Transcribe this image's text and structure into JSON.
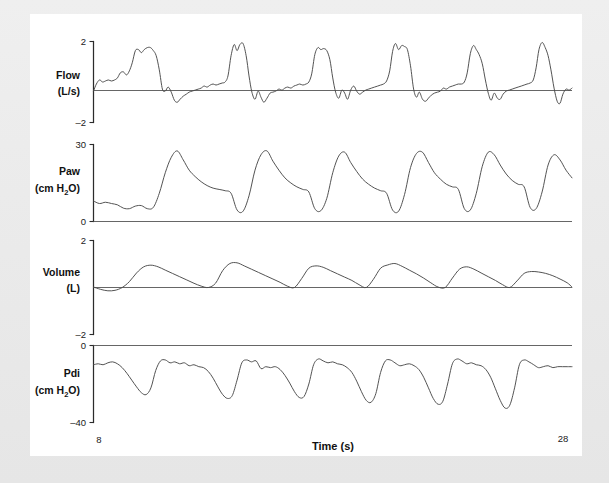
{
  "figure": {
    "background_color": "#e9e9e9",
    "card_color": "#ffffff",
    "trace_color": "#4a4a4a",
    "axis_color": "#2b2b2b",
    "xaxis_title": "Time (s)",
    "x_tick_left": "8",
    "x_tick_right": "28"
  },
  "panels": {
    "flow": {
      "label_line1": "Flow",
      "label_line2": "(L/s)",
      "tick_top": "2",
      "tick_bottom": "–2",
      "unit": "L/s"
    },
    "paw": {
      "label_line1": "Paw",
      "label_line2_pre": "(cm H",
      "label_line2_sub": "2",
      "label_line2_post": "O)",
      "tick_top": "30",
      "tick_bottom": "0",
      "unit": "cm H2O"
    },
    "volume": {
      "label_line1": "Volume",
      "label_line2": "(L)",
      "tick_top": "2",
      "tick_bottom": "–2",
      "unit": "L"
    },
    "pdi": {
      "label_line1": "Pdi",
      "label_line2_pre": "(cm H",
      "label_line2_sub": "2",
      "label_line2_post": "O)",
      "tick_top": "0",
      "tick_bottom": "–40",
      "unit": "cm H2O"
    }
  },
  "chart_data": [
    {
      "type": "line",
      "title": "Flow",
      "xlabel": "Time (s)",
      "ylabel": "Flow (L/s)",
      "xlim": [
        8,
        28
      ],
      "ylim": [
        -2,
        2
      ],
      "grid": false,
      "legend": "none",
      "zero_line": true,
      "series": [
        {
          "name": "Flow",
          "x": [
            8.0,
            8.12,
            8.25,
            8.38,
            8.5,
            8.62,
            8.75,
            8.88,
            9.0,
            9.12,
            9.25,
            9.38,
            9.5,
            9.62,
            9.75,
            9.88,
            10.0,
            10.12,
            10.25,
            10.38,
            10.5,
            10.62,
            10.75,
            10.88,
            11.0,
            11.12,
            11.25,
            11.38,
            11.5,
            11.62,
            11.75,
            11.88,
            12.0,
            12.12,
            12.25,
            12.38,
            12.5,
            12.62,
            12.75,
            12.88,
            13.0,
            13.12,
            13.25,
            13.38,
            13.5,
            13.62,
            13.75,
            13.88,
            14.0,
            14.12,
            14.25,
            14.38,
            14.5,
            14.62,
            14.75,
            14.88,
            15.0,
            15.12,
            15.25,
            15.38,
            15.5,
            15.62,
            15.75,
            15.88,
            16.0,
            16.12,
            16.25,
            16.38,
            16.5,
            16.62,
            16.75,
            16.88,
            17.0,
            17.12,
            17.25,
            17.38,
            17.5,
            17.62,
            17.75,
            17.88,
            18.0,
            18.12,
            18.25,
            18.38,
            18.5,
            18.62,
            18.75,
            18.88,
            19.0,
            19.12,
            19.25,
            19.38,
            19.5,
            19.62,
            19.75,
            19.88,
            20.0,
            20.12,
            20.25,
            20.38,
            20.5,
            20.62,
            20.75,
            20.88,
            21.0,
            21.12,
            21.25,
            21.38,
            21.5,
            21.62,
            21.75,
            21.88,
            22.0,
            22.12,
            22.25,
            22.38,
            22.5,
            22.62,
            22.75,
            22.88,
            23.0,
            23.12,
            23.25,
            23.38,
            23.5,
            23.62,
            23.75,
            23.88,
            24.0,
            24.12,
            24.25,
            24.38,
            24.5,
            24.62,
            24.75,
            24.88,
            25.0,
            25.12,
            25.25,
            25.38,
            25.5,
            25.62,
            25.75,
            25.88,
            26.0,
            26.12,
            26.25,
            26.38,
            26.5,
            26.62,
            26.75,
            26.88,
            27.0,
            27.12,
            27.25,
            27.38,
            27.5,
            27.62,
            27.75,
            27.88,
            28.0
          ],
          "y": [
            -0.45,
            -0.1,
            0.1,
            0.0,
            0.05,
            0.1,
            0.05,
            0.1,
            0.2,
            0.45,
            0.5,
            0.35,
            0.55,
            0.95,
            1.55,
            1.6,
            1.45,
            1.6,
            1.7,
            1.7,
            1.55,
            1.3,
            0.6,
            -0.35,
            -0.45,
            -0.25,
            -0.5,
            -0.9,
            -1.0,
            -0.85,
            -0.7,
            -0.6,
            -0.5,
            -0.45,
            -0.4,
            -0.35,
            -0.3,
            -0.2,
            -0.25,
            -0.15,
            -0.1,
            -0.15,
            -0.1,
            -0.05,
            0.0,
            0.3,
            1.3,
            1.85,
            1.55,
            1.85,
            1.9,
            1.3,
            0.3,
            -0.5,
            -0.85,
            -0.45,
            -0.75,
            -1.0,
            -0.8,
            -0.55,
            -0.5,
            -0.45,
            -0.35,
            -0.4,
            -0.3,
            -0.25,
            -0.3,
            -0.2,
            -0.15,
            -0.1,
            -0.15,
            -0.1,
            0.0,
            0.4,
            1.35,
            1.7,
            1.6,
            1.65,
            1.55,
            1.1,
            0.2,
            -0.5,
            -0.8,
            -0.4,
            -0.55,
            -0.85,
            -0.4,
            -0.2,
            -0.45,
            -0.6,
            -0.5,
            -0.4,
            -0.35,
            -0.3,
            -0.25,
            -0.2,
            -0.15,
            -0.1,
            0.05,
            0.55,
            1.5,
            1.9,
            1.6,
            1.8,
            1.75,
            1.6,
            0.8,
            -0.35,
            -0.75,
            -0.5,
            -0.85,
            -0.95,
            -0.8,
            -0.65,
            -0.55,
            -0.5,
            -0.45,
            -0.3,
            -0.35,
            -0.25,
            -0.2,
            -0.15,
            -0.1,
            -0.1,
            0.0,
            0.45,
            1.4,
            1.8,
            1.6,
            1.35,
            0.9,
            0.1,
            -0.55,
            -0.9,
            -0.55,
            -0.8,
            -0.85,
            -0.6,
            -0.45,
            -0.4,
            -0.35,
            -0.3,
            -0.25,
            -0.2,
            -0.15,
            -0.1,
            -0.05,
            0.1,
            0.7,
            1.6,
            1.95,
            1.7,
            1.3,
            0.6,
            -0.3,
            -0.95,
            -1.05,
            -0.6,
            -0.35,
            -0.4,
            -0.3,
            -0.2,
            -0.15,
            -0.1,
            -0.1,
            -0.08,
            -0.08
          ]
        }
      ]
    },
    {
      "type": "line",
      "title": "Paw",
      "xlabel": "Time (s)",
      "ylabel": "Paw (cm H2O)",
      "xlim": [
        8,
        28
      ],
      "ylim": [
        0,
        30
      ],
      "grid": false,
      "legend": "none",
      "zero_line": true,
      "series": [
        {
          "name": "Paw",
          "x": [
            8.0,
            8.25,
            8.5,
            8.75,
            9.0,
            9.25,
            9.5,
            9.75,
            10.0,
            10.25,
            10.5,
            10.75,
            11.0,
            11.25,
            11.5,
            11.75,
            12.0,
            12.25,
            12.5,
            12.75,
            13.0,
            13.25,
            13.5,
            13.75,
            14.0,
            14.25,
            14.5,
            14.75,
            15.0,
            15.25,
            15.5,
            15.75,
            16.0,
            16.25,
            16.5,
            16.75,
            17.0,
            17.25,
            17.5,
            17.75,
            18.0,
            18.25,
            18.5,
            18.75,
            19.0,
            19.25,
            19.5,
            19.75,
            20.0,
            20.25,
            20.5,
            20.75,
            21.0,
            21.25,
            21.5,
            21.75,
            22.0,
            22.25,
            22.5,
            22.75,
            23.0,
            23.25,
            23.5,
            23.75,
            24.0,
            24.25,
            24.5,
            24.75,
            25.0,
            25.25,
            25.5,
            25.75,
            26.0,
            26.25,
            26.5,
            26.75,
            27.0,
            27.25,
            27.5,
            27.75,
            28.0
          ],
          "y": [
            8.0,
            7.0,
            7.5,
            7.0,
            6.5,
            5.2,
            5.0,
            6.0,
            6.2,
            5.0,
            5.5,
            11.0,
            19.0,
            25.0,
            27.5,
            24.0,
            20.0,
            17.5,
            15.5,
            14.0,
            13.0,
            12.5,
            12.0,
            11.0,
            4.5,
            4.0,
            10.0,
            20.0,
            26.0,
            27.5,
            23.5,
            20.0,
            17.0,
            15.0,
            13.5,
            12.5,
            11.5,
            5.0,
            4.2,
            9.0,
            19.0,
            25.5,
            27.0,
            23.0,
            19.5,
            16.5,
            14.5,
            13.0,
            12.0,
            11.0,
            4.5,
            4.0,
            10.5,
            21.0,
            26.5,
            27.0,
            23.0,
            19.0,
            16.5,
            14.5,
            13.5,
            12.5,
            5.0,
            4.5,
            11.0,
            21.5,
            27.0,
            26.0,
            22.0,
            18.5,
            16.0,
            14.5,
            13.5,
            5.5,
            5.0,
            11.5,
            22.0,
            26.0,
            24.0,
            20.0,
            17.0
          ]
        }
      ]
    },
    {
      "type": "line",
      "title": "Volume",
      "xlabel": "Time (s)",
      "ylabel": "Volume (L)",
      "xlim": [
        8,
        28
      ],
      "ylim": [
        -2,
        2
      ],
      "grid": false,
      "legend": "none",
      "zero_line": true,
      "series": [
        {
          "name": "Volume",
          "x": [
            8.0,
            8.3,
            8.6,
            8.9,
            9.2,
            9.5,
            9.8,
            10.1,
            10.4,
            10.7,
            11.0,
            11.3,
            11.6,
            11.9,
            12.2,
            12.5,
            12.8,
            13.1,
            13.4,
            13.7,
            14.0,
            14.3,
            14.6,
            14.9,
            15.2,
            15.5,
            15.8,
            16.1,
            16.4,
            16.7,
            17.0,
            17.3,
            17.6,
            17.9,
            18.2,
            18.5,
            18.8,
            19.1,
            19.4,
            19.7,
            20.0,
            20.3,
            20.6,
            20.9,
            21.2,
            21.5,
            21.8,
            22.1,
            22.4,
            22.7,
            23.0,
            23.3,
            23.6,
            23.9,
            24.2,
            24.5,
            24.8,
            25.1,
            25.4,
            25.7,
            26.0,
            26.3,
            26.6,
            26.9,
            27.2,
            27.5,
            27.8,
            28.0
          ],
          "y": [
            0.02,
            -0.08,
            -0.14,
            -0.12,
            0.0,
            0.25,
            0.62,
            0.88,
            0.95,
            0.88,
            0.74,
            0.6,
            0.46,
            0.32,
            0.18,
            0.06,
            0.0,
            0.18,
            0.72,
            1.02,
            1.05,
            0.92,
            0.78,
            0.64,
            0.5,
            0.36,
            0.22,
            0.06,
            0.0,
            0.38,
            0.82,
            0.92,
            0.86,
            0.72,
            0.58,
            0.44,
            0.3,
            0.12,
            0.0,
            0.35,
            0.82,
            0.96,
            1.02,
            0.9,
            0.74,
            0.58,
            0.4,
            0.2,
            0.02,
            0.0,
            0.4,
            0.78,
            0.88,
            0.78,
            0.62,
            0.46,
            0.3,
            0.12,
            0.0,
            0.28,
            0.6,
            0.68,
            0.66,
            0.6,
            0.5,
            0.36,
            0.2,
            0.02
          ]
        }
      ]
    },
    {
      "type": "line",
      "title": "Pdi",
      "xlabel": "Time (s)",
      "ylabel": "Pdi (cm H2O)",
      "xlim": [
        8,
        28
      ],
      "ylim": [
        -40,
        0
      ],
      "grid": false,
      "legend": "none",
      "zero_line": true,
      "series": [
        {
          "name": "Pdi",
          "x": [
            8.0,
            8.2,
            8.4,
            8.6,
            8.8,
            9.0,
            9.2,
            9.4,
            9.6,
            9.8,
            10.0,
            10.2,
            10.4,
            10.6,
            10.8,
            11.0,
            11.2,
            11.4,
            11.6,
            11.8,
            12.0,
            12.2,
            12.4,
            12.6,
            12.8,
            13.0,
            13.2,
            13.4,
            13.6,
            13.8,
            14.0,
            14.2,
            14.4,
            14.6,
            14.8,
            15.0,
            15.2,
            15.4,
            15.6,
            15.8,
            16.0,
            16.2,
            16.4,
            16.6,
            16.8,
            17.0,
            17.2,
            17.4,
            17.6,
            17.8,
            18.0,
            18.2,
            18.4,
            18.6,
            18.8,
            19.0,
            19.2,
            19.4,
            19.6,
            19.8,
            20.0,
            20.2,
            20.4,
            20.6,
            20.8,
            21.0,
            21.2,
            21.4,
            21.6,
            21.8,
            22.0,
            22.2,
            22.4,
            22.6,
            22.8,
            23.0,
            23.2,
            23.4,
            23.6,
            23.8,
            24.0,
            24.2,
            24.4,
            24.6,
            24.8,
            25.0,
            25.2,
            25.4,
            25.6,
            25.8,
            26.0,
            26.2,
            26.4,
            26.6,
            26.8,
            27.0,
            27.2,
            27.4,
            27.6,
            27.8,
            28.0
          ],
          "y": [
            -10.0,
            -9.5,
            -10.0,
            -9.0,
            -8.5,
            -9.5,
            -11.5,
            -14.5,
            -18.0,
            -21.5,
            -24.5,
            -25.5,
            -22.0,
            -13.0,
            -8.0,
            -7.5,
            -9.0,
            -8.5,
            -9.5,
            -9.0,
            -10.5,
            -10.0,
            -11.0,
            -11.5,
            -13.5,
            -17.0,
            -21.5,
            -25.5,
            -27.5,
            -26.0,
            -18.0,
            -9.0,
            -7.5,
            -8.5,
            -8.0,
            -12.0,
            -11.0,
            -11.5,
            -11.0,
            -12.5,
            -15.5,
            -19.5,
            -24.0,
            -27.0,
            -26.5,
            -20.0,
            -10.0,
            -7.0,
            -8.0,
            -9.0,
            -8.5,
            -9.5,
            -10.0,
            -11.5,
            -14.0,
            -18.5,
            -24.0,
            -28.5,
            -29.5,
            -25.0,
            -14.0,
            -8.0,
            -7.5,
            -9.0,
            -10.5,
            -10.0,
            -9.5,
            -10.5,
            -12.5,
            -16.5,
            -22.0,
            -27.5,
            -30.5,
            -29.0,
            -20.0,
            -9.5,
            -7.0,
            -8.0,
            -9.5,
            -9.0,
            -10.0,
            -10.5,
            -12.5,
            -16.5,
            -22.5,
            -28.5,
            -32.5,
            -31.0,
            -22.0,
            -10.0,
            -7.5,
            -8.5,
            -10.0,
            -11.5,
            -11.0,
            -10.5,
            -11.5,
            -11.0,
            -11.0,
            -11.0,
            -11.0
          ]
        }
      ]
    }
  ]
}
